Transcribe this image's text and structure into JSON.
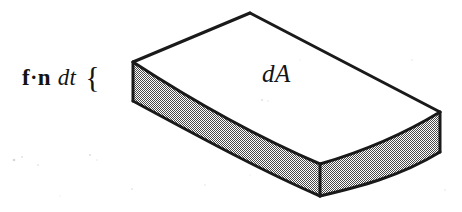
{
  "figure": {
    "background_color": "#ffffff",
    "ink_color": "#1a1a1a",
    "labels": {
      "flux": {
        "vector_f": "f",
        "dot": "·",
        "vector_n": "n",
        "differential": "dt",
        "brace": "{",
        "full_text": "f·n dt {"
      },
      "area": {
        "text": "dA"
      }
    },
    "solid": {
      "name": "curved-slab",
      "top_face_fill": "#ffffff",
      "side_face_fill": "#a8a8a8",
      "stipple_pattern": "checkerboard-dither",
      "stroke_color": "#1a1a1a",
      "stroke_width": 3,
      "geometry": {
        "top_back_left": [
          133,
          62
        ],
        "top_apex": [
          250,
          13
        ],
        "top_right": [
          440,
          112
        ],
        "top_front_right": [
          320,
          164
        ],
        "bottom_left": [
          133,
          101
        ],
        "bottom_right": [
          440,
          152
        ],
        "bottom_front_right": [
          320,
          196
        ],
        "front_curve_sag": 22,
        "back_curve_rise": 18,
        "slab_thickness": 39
      }
    },
    "speckles": [
      {
        "x": 14,
        "y": 160,
        "r": 1.3,
        "o": 0.16
      },
      {
        "x": 22,
        "y": 157,
        "r": 0.9,
        "o": 0.13
      },
      {
        "x": 38,
        "y": 165,
        "r": 1.0,
        "o": 0.1
      },
      {
        "x": 90,
        "y": 155,
        "r": 1.1,
        "o": 0.12
      },
      {
        "x": 97,
        "y": 160,
        "r": 0.8,
        "o": 0.09
      },
      {
        "x": 132,
        "y": 189,
        "r": 1.0,
        "o": 0.1
      },
      {
        "x": 205,
        "y": 185,
        "r": 0.9,
        "o": 0.08
      },
      {
        "x": 250,
        "y": 175,
        "r": 0.8,
        "o": 0.07
      },
      {
        "x": 262,
        "y": 100,
        "r": 1.0,
        "o": 0.12
      },
      {
        "x": 268,
        "y": 101,
        "r": 0.8,
        "o": 0.1
      },
      {
        "x": 300,
        "y": 60,
        "r": 0.8,
        "o": 0.07
      },
      {
        "x": 412,
        "y": 60,
        "r": 0.9,
        "o": 0.07
      },
      {
        "x": 445,
        "y": 190,
        "r": 0.9,
        "o": 0.08
      },
      {
        "x": 60,
        "y": 196,
        "r": 0.8,
        "o": 0.07
      }
    ]
  }
}
